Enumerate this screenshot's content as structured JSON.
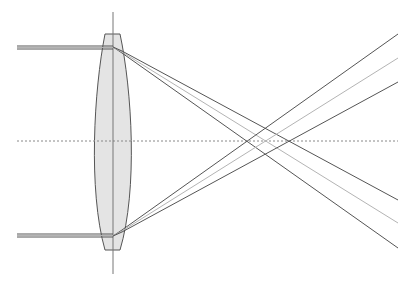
{
  "diagram": {
    "width": 414,
    "height": 286,
    "colors": {
      "background": "#ffffff",
      "lens_fill": "#e4e4e4",
      "lens_stroke": "#555555",
      "axis": "#777777",
      "optical_axis": "#888888",
      "ray_dark": "#555555",
      "ray_light": "#b4b4b4"
    },
    "optical_axis": {
      "y": 141,
      "x_start": 17,
      "x_end": 398,
      "style": "dotted"
    },
    "lens_axis": {
      "x": 113,
      "y_start": 12,
      "y_end": 274
    },
    "lens": {
      "top_y": 34,
      "bottom_y": 250,
      "top_edge": [
        105,
        120
      ],
      "bottom_edge": [
        105,
        120
      ],
      "widest": [
        92,
        134
      ]
    },
    "incoming_beams": [
      {
        "name": "upper",
        "y": 47,
        "x_start": 17,
        "x_end": 113
      },
      {
        "name": "lower",
        "y": 236,
        "x_start": 17,
        "x_end": 113
      }
    ],
    "focal_crossings_x": [
      247,
      266,
      290
    ],
    "rays": [
      {
        "from": [
          113,
          47
        ],
        "bend": [
          122,
          52
        ],
        "focus_x": 247,
        "end": [
          398,
          248
        ],
        "tone": "dark"
      },
      {
        "from": [
          113,
          47
        ],
        "bend": [
          122,
          52
        ],
        "focus_x": 266,
        "end": [
          398,
          223
        ],
        "tone": "light"
      },
      {
        "from": [
          113,
          47
        ],
        "bend": [
          122,
          51
        ],
        "focus_x": 290,
        "end": [
          398,
          200
        ],
        "tone": "dark"
      },
      {
        "from": [
          113,
          236
        ],
        "bend": [
          122,
          230
        ],
        "focus_x": 247,
        "end": [
          398,
          34
        ],
        "tone": "dark"
      },
      {
        "from": [
          113,
          236
        ],
        "bend": [
          122,
          230
        ],
        "focus_x": 266,
        "end": [
          398,
          58
        ],
        "tone": "light"
      },
      {
        "from": [
          113,
          236
        ],
        "bend": [
          122,
          231
        ],
        "focus_x": 290,
        "end": [
          398,
          82
        ],
        "tone": "dark"
      }
    ]
  }
}
